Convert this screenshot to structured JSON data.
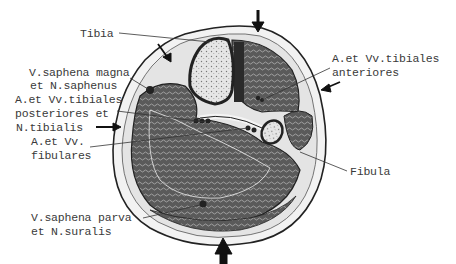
{
  "diagram": {
    "type": "anatomical cross-section",
    "labels": {
      "tibia": "Tibia",
      "saphena_magna_1": "V.saphena magna",
      "saphena_magna_2": "et N.saphenus",
      "tib_post_1": "A.et Vv.tibiales",
      "tib_post_2": "posteriores et",
      "tib_post_3": "N.tibialis",
      "fibulares_1": "A.et Vv.",
      "fibulares_2": "fibulares",
      "saphena_parva_1": "V.saphena parva",
      "saphena_parva_2": "et N.suralis",
      "tib_ant_1": "A.et Vv.tibiales",
      "tib_ant_2": "anteriores",
      "fibula": "Fibula"
    },
    "arrows": [
      "top",
      "top-left",
      "left",
      "right",
      "bottom"
    ],
    "colors": {
      "line": "#222222",
      "muscle": "#4a4a4a",
      "fat": "#e8e8e8",
      "bone": "#d8d8d8",
      "text": "#3a3a3a"
    }
  }
}
